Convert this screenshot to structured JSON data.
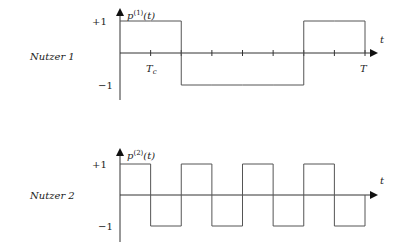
{
  "diagram": {
    "type": "spreading-code-waveforms",
    "signals": [
      {
        "user_label": "Nutzer 1",
        "signal_label_base": "p",
        "signal_label_sup": "(1)",
        "signal_label_arg": "(t)",
        "y_ticks": [
          "+1",
          "−1"
        ],
        "x_axis_label": "t",
        "x_tick_labels": {
          "first": "T",
          "first_sub": "c",
          "last": "T"
        },
        "chip_values": [
          1,
          1,
          -1,
          -1,
          -1,
          -1,
          1,
          1
        ],
        "show_ticks": true
      },
      {
        "user_label": "Nutzer 2",
        "signal_label_base": "p",
        "signal_label_sup": "(2)",
        "signal_label_arg": "(t)",
        "y_ticks": [
          "+1",
          "−1"
        ],
        "x_axis_label": "t",
        "chip_values": [
          1,
          -1,
          1,
          -1,
          1,
          -1,
          1,
          -1
        ],
        "show_ticks": false
      }
    ],
    "colors": {
      "axis": "#333333",
      "signal": "#555555",
      "text": "#222222"
    }
  }
}
